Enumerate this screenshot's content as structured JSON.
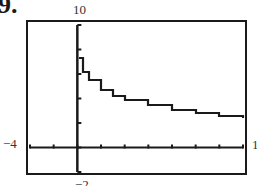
{
  "problem": {
    "number": "9."
  },
  "window": {
    "xmin_label": "−4",
    "xmax_label": "14",
    "ymax_label": "10",
    "ymin_label": "−2"
  },
  "chart_data": {
    "type": "line",
    "title": "",
    "xlabel": "",
    "ylabel": "",
    "xlim": [
      -4,
      14
    ],
    "ylim": [
      -2,
      10
    ],
    "xscale_tick": 2,
    "yscale_tick": 2,
    "grid": false,
    "legend": null,
    "annotations": [
      "9.",
      "10",
      "-4",
      "14",
      "-2"
    ],
    "series": [
      {
        "name": "f(x)",
        "x": [
          0.1,
          0.5,
          1,
          2,
          3,
          4,
          6,
          8,
          10,
          12,
          14
        ],
        "y": [
          7.3,
          6.2,
          5.5,
          4.7,
          4.2,
          3.9,
          3.5,
          3.1,
          2.8,
          2.6,
          2.4
        ]
      }
    ]
  }
}
